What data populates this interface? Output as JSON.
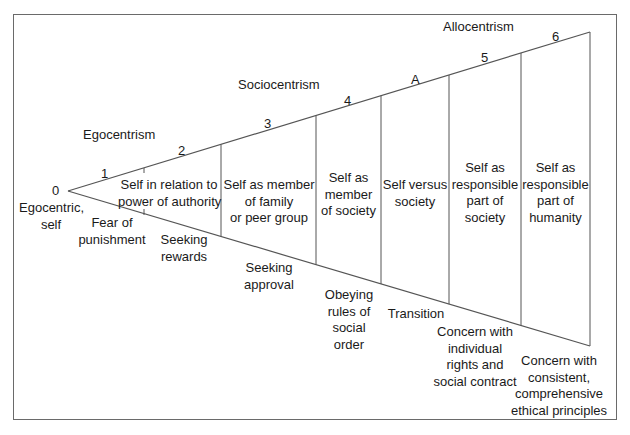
{
  "diagram": {
    "zones": [
      {
        "label": "Egocentrism"
      },
      {
        "label": "Sociocentrism"
      },
      {
        "label": "Allocentrism"
      }
    ],
    "markers": [
      "0",
      "1",
      "2",
      "3",
      "4",
      "A",
      "5",
      "6"
    ],
    "origin": {
      "label_line1": "Egocentric,",
      "label_line2": "self"
    },
    "stages_upper": [
      {
        "lines": [
          "Self in relation to",
          "power of authority"
        ]
      },
      {
        "lines": [
          "Self as member",
          "of family",
          "or peer group"
        ]
      },
      {
        "lines": [
          "Self as",
          "member",
          "of society"
        ]
      },
      {
        "lines": [
          "Self versus",
          "society"
        ]
      },
      {
        "lines": [
          "Self as",
          "responsible",
          "part of",
          "society"
        ]
      },
      {
        "lines": [
          "Self as",
          "responsible",
          "part of",
          "humanity"
        ]
      }
    ],
    "stages_lower": [
      {
        "lines": [
          "Fear of",
          "punishment"
        ]
      },
      {
        "lines": [
          "Seeking",
          "rewards"
        ]
      },
      {
        "lines": [
          "Seeking",
          "approval"
        ]
      },
      {
        "lines": [
          "Obeying",
          "rules of",
          "social",
          "order"
        ]
      },
      {
        "lines": [
          "Transition"
        ]
      },
      {
        "lines": [
          "Concern with",
          "individual",
          "rights and",
          "social contract"
        ]
      },
      {
        "lines": [
          "Concern with",
          "consistent,",
          "comprehensive",
          "ethical principles"
        ]
      }
    ],
    "colors": {
      "line": "#555555",
      "frame": "#6a6a6a",
      "text": "#1a1a1a"
    }
  }
}
